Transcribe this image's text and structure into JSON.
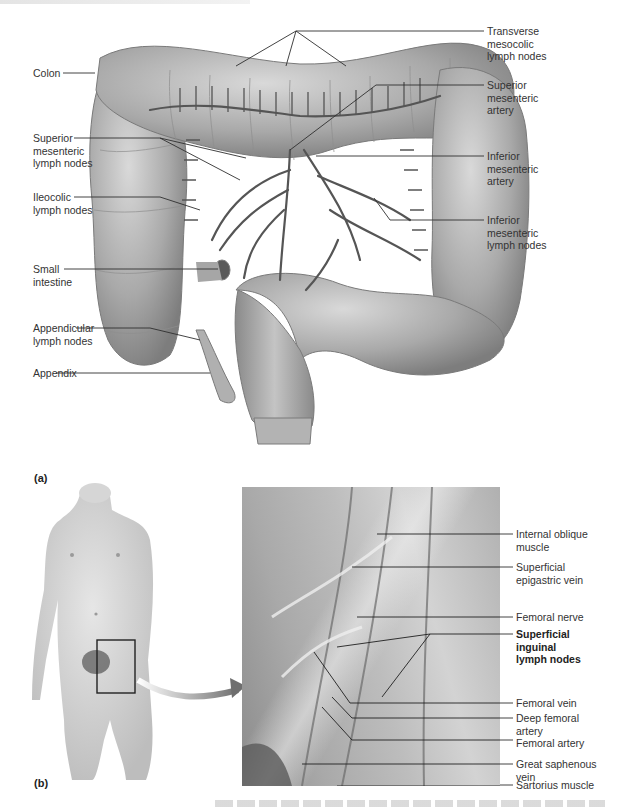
{
  "figure": {
    "panel_a": {
      "tag": "(a)",
      "labels_left": [
        {
          "id": "colon",
          "text": "Colon"
        },
        {
          "id": "superior-mesenteric-lymph-nodes",
          "text": "Superior\nmesenteric\nlymph nodes"
        },
        {
          "id": "ileocolic-lymph-nodes",
          "text": "Ileocolic\nlymph nodes"
        },
        {
          "id": "small-intestine",
          "text": "Small\nintestine"
        },
        {
          "id": "appendicular-lymph-nodes",
          "text": "Appendicular\nlymph nodes"
        },
        {
          "id": "appendix",
          "text": "Appendix"
        }
      ],
      "labels_right": [
        {
          "id": "transverse-mesocolic-lymph-nodes",
          "text": "Transverse\nmesocolic\nlymph nodes"
        },
        {
          "id": "superior-mesenteric-artery",
          "text": "Superior\nmesenteric\nartery"
        },
        {
          "id": "inferior-mesenteric-artery",
          "text": "Inferior\nmesenteric\nartery"
        },
        {
          "id": "inferior-mesenteric-lymph-nodes",
          "text": "Inferior\nmesenteric\nlymph nodes"
        }
      ]
    },
    "panel_b": {
      "tag": "(b)",
      "labels_right": [
        {
          "id": "internal-oblique-muscle",
          "text": "Internal oblique\nmuscle",
          "bold": false
        },
        {
          "id": "superficial-epigastric-vein",
          "text": "Superficial\nepigastric vein",
          "bold": false
        },
        {
          "id": "femoral-nerve",
          "text": "Femoral nerve",
          "bold": false
        },
        {
          "id": "superficial-inguinal-lymph-nodes",
          "text": "Superficial\ninguinal\nlymph nodes",
          "bold": true
        },
        {
          "id": "femoral-vein",
          "text": "Femoral vein",
          "bold": false
        },
        {
          "id": "deep-femoral-artery",
          "text": "Deep femoral\nartery",
          "bold": false
        },
        {
          "id": "femoral-artery",
          "text": "Femoral artery",
          "bold": false
        },
        {
          "id": "great-saphenous-vein",
          "text": "Great saphenous\nvein",
          "bold": false
        },
        {
          "id": "sartorius-muscle",
          "text": "Sartorius muscle",
          "bold": false
        }
      ]
    }
  }
}
